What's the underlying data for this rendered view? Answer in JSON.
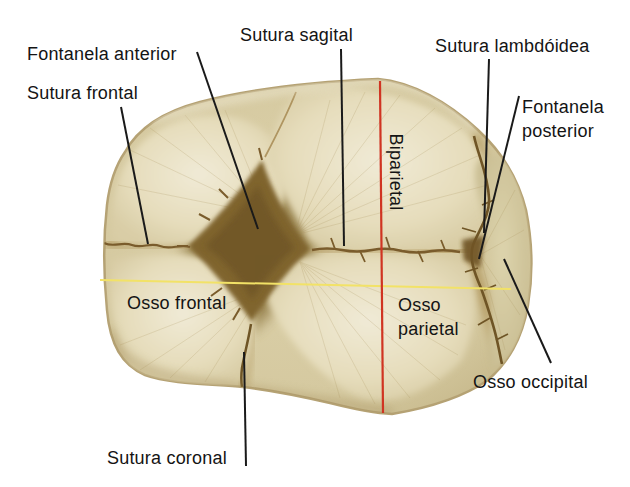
{
  "figure": {
    "labels": {
      "fontanela_anterior": "Fontanela anterior",
      "sutura_frontal": "Sutura frontal",
      "sutura_sagital": "Sutura sagital",
      "sutura_lambdoidea": "Sutura lambdóidea",
      "fontanela_posterior": "Fontanela posterior",
      "biparietal": "Biparietal",
      "osso_frontal": "Osso frontal",
      "osso_parietal": "Osso parietal",
      "osso_occipital": "Osso occipital",
      "sutura_coronal": "Sutura coronal"
    },
    "colors": {
      "background": "#ffffff",
      "bone_base": "#d5c9a0",
      "bone_light": "#f0ead6",
      "bone_rim": "#b5a274",
      "suture_brown": "#6f5526",
      "fontanelle_olive": "#80652f",
      "leader_line": "#1a1a1a",
      "biparietal_line": "#d03422",
      "reference_line": "#f2e267"
    }
  }
}
